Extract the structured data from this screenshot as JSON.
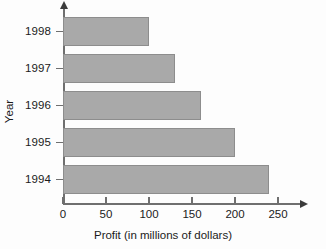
{
  "chart_data": {
    "type": "bar",
    "orientation": "horizontal",
    "title": "",
    "xlabel": "Profit (in millions of dollars)",
    "ylabel": "Year",
    "categories": [
      "1998",
      "1997",
      "1996",
      "1995",
      "1994"
    ],
    "values": [
      100,
      130,
      160,
      200,
      240
    ],
    "series": [
      {
        "name": "Profit",
        "values": [
          100,
          130,
          160,
          200,
          240
        ]
      }
    ],
    "xlim": [
      0,
      250
    ],
    "xticks": [
      0,
      50,
      100,
      150,
      200,
      250
    ],
    "xtick_labels": [
      "0",
      "50",
      "100",
      "150",
      "200",
      "250"
    ],
    "grid": false,
    "legend": false,
    "bar_color": "#a9a9a9",
    "bar_border_color": "#8d8d8d",
    "axis_color": "#6f6f6f",
    "text_color": "#1b1b1b"
  }
}
